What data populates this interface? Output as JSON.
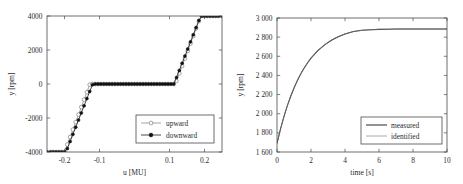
{
  "figure": {
    "background_color": "#ffffff",
    "panel_count": 2
  },
  "chart_data": [
    {
      "type": "line",
      "id": "hysteresis-characteristic",
      "title": "",
      "xlabel": "u [MU]",
      "ylabel": "y [rpm]",
      "xlim": [
        -0.25,
        0.25
      ],
      "ylim": [
        -4000,
        4000
      ],
      "xticks": [
        -0.2,
        -0.1,
        0.1,
        0.2
      ],
      "xticklabels": [
        "-0.2",
        "-0.1",
        "0.1",
        "0.2"
      ],
      "yticks": [
        -4000,
        -2000,
        0,
        2000,
        4000
      ],
      "yticklabels": [
        "-4000",
        "-2000",
        "0",
        "2000",
        "4000"
      ],
      "grid": false,
      "legend_position": "lower right",
      "marker_step": 0.008,
      "series": [
        {
          "name": "upward",
          "color": "#8d8d8d",
          "marker": "open-circle",
          "x": [
            -0.25,
            -0.24,
            -0.232,
            -0.224,
            -0.216,
            -0.208,
            -0.2,
            -0.192,
            -0.184,
            -0.176,
            -0.168,
            -0.16,
            -0.152,
            -0.144,
            -0.136,
            -0.128,
            -0.12,
            -0.112,
            -0.104,
            -0.096,
            -0.088,
            -0.08,
            -0.072,
            -0.064,
            -0.056,
            -0.048,
            -0.04,
            -0.032,
            -0.024,
            -0.016,
            -0.008,
            0.0,
            0.008,
            0.016,
            0.024,
            0.032,
            0.04,
            0.048,
            0.056,
            0.064,
            0.072,
            0.08,
            0.088,
            0.096,
            0.104,
            0.112,
            0.12,
            0.128,
            0.136,
            0.144,
            0.152,
            0.16,
            0.168,
            0.176,
            0.184,
            0.192,
            0.2,
            0.208,
            0.216,
            0.224,
            0.232,
            0.24,
            0.25
          ],
          "y": [
            -4000,
            -4000,
            -4000,
            -4000,
            -4000,
            -4000,
            -4000,
            -3560,
            -3120,
            -2680,
            -2240,
            -1800,
            -1360,
            -920,
            -480,
            -40,
            0,
            0,
            0,
            0,
            0,
            0,
            0,
            0,
            0,
            0,
            0,
            0,
            0,
            0,
            0,
            0,
            0,
            0,
            0,
            0,
            0,
            0,
            0,
            0,
            0,
            0,
            0,
            0,
            0,
            0,
            180,
            620,
            1060,
            1500,
            1940,
            2380,
            2820,
            3260,
            3700,
            4000,
            4000,
            4000,
            4000,
            4000,
            4000,
            4000,
            4000
          ]
        },
        {
          "name": "downward",
          "color": "#1c1c1c",
          "marker": "filled-circle",
          "x": [
            -0.25,
            -0.24,
            -0.232,
            -0.224,
            -0.216,
            -0.208,
            -0.2,
            -0.192,
            -0.184,
            -0.176,
            -0.168,
            -0.16,
            -0.152,
            -0.144,
            -0.136,
            -0.128,
            -0.12,
            -0.112,
            -0.104,
            -0.096,
            -0.088,
            -0.08,
            -0.072,
            -0.064,
            -0.056,
            -0.048,
            -0.04,
            -0.032,
            -0.024,
            -0.016,
            -0.008,
            0.0,
            0.008,
            0.016,
            0.024,
            0.032,
            0.04,
            0.048,
            0.056,
            0.064,
            0.072,
            0.08,
            0.088,
            0.096,
            0.104,
            0.112,
            0.12,
            0.128,
            0.136,
            0.144,
            0.152,
            0.16,
            0.168,
            0.176,
            0.184,
            0.192,
            0.2,
            0.208,
            0.216,
            0.224,
            0.232,
            0.24,
            0.25
          ],
          "y": [
            -4000,
            -4000,
            -4000,
            -4000,
            -4000,
            -4000,
            -4000,
            -3800,
            -3380,
            -2960,
            -2540,
            -2120,
            -1700,
            -1280,
            -860,
            -440,
            -40,
            0,
            0,
            0,
            0,
            0,
            0,
            0,
            0,
            0,
            0,
            0,
            0,
            0,
            0,
            0,
            0,
            0,
            0,
            0,
            0,
            0,
            0,
            0,
            0,
            0,
            0,
            0,
            0,
            0,
            380,
            800,
            1220,
            1640,
            2060,
            2480,
            2900,
            3320,
            3740,
            4000,
            4000,
            4000,
            4000,
            4000,
            4000,
            4000,
            4000
          ]
        }
      ]
    },
    {
      "type": "line",
      "id": "step-response",
      "title": "",
      "xlabel": "time [s]",
      "ylabel": "y [rpm]",
      "xlim": [
        0,
        10
      ],
      "ylim": [
        1600,
        3000
      ],
      "xticks": [
        0,
        2,
        4,
        6,
        8,
        10
      ],
      "xticklabels": [
        "0",
        "2",
        "4",
        "6",
        "8",
        "10"
      ],
      "yticks": [
        1600,
        1800,
        2000,
        2200,
        2400,
        2600,
        2800,
        3000
      ],
      "yticklabels": [
        "1 600",
        "1 800",
        "2 000",
        "2 200",
        "2 400",
        "2 600",
        "2 800",
        "3 000"
      ],
      "grid": false,
      "legend_position": "lower right",
      "series": [
        {
          "name": "measured",
          "color": "#2f2f2f",
          "steady_state": 2885,
          "initial_value": 1690,
          "time_constant": 1.55,
          "x": [
            0,
            0.2,
            0.4,
            0.6,
            0.8,
            1.0,
            1.2,
            1.4,
            1.6,
            1.8,
            2.0,
            2.4,
            2.8,
            3.2,
            3.6,
            4.0,
            4.5,
            5.0,
            5.5,
            6.0,
            6.5,
            7.0,
            7.5,
            8.0,
            8.5,
            9.0,
            9.5,
            10.0
          ],
          "y": [
            1690,
            1836,
            1965,
            2079,
            2180,
            2269,
            2348,
            2417,
            2478,
            2532,
            2580,
            2659,
            2720,
            2768,
            2805,
            2834,
            2859,
            2871,
            2878,
            2881,
            2883,
            2884,
            2885,
            2885,
            2885,
            2886,
            2886,
            2886
          ]
        },
        {
          "name": "identified",
          "color": "#7c7c7c",
          "steady_state": 2882,
          "initial_value": 1690,
          "time_constant": 1.55,
          "x": [
            0,
            0.2,
            0.4,
            0.6,
            0.8,
            1.0,
            1.2,
            1.4,
            1.6,
            1.8,
            2.0,
            2.4,
            2.8,
            3.2,
            3.6,
            4.0,
            4.5,
            5.0,
            5.5,
            6.0,
            6.5,
            7.0,
            7.5,
            8.0,
            8.5,
            9.0,
            9.5,
            10.0
          ],
          "y": [
            1690,
            1836,
            1965,
            2079,
            2180,
            2269,
            2348,
            2417,
            2478,
            2532,
            2580,
            2659,
            2720,
            2768,
            2805,
            2834,
            2859,
            2871,
            2878,
            2881,
            2883,
            2884,
            2884,
            2884,
            2884,
            2884,
            2884,
            2884
          ]
        }
      ]
    }
  ]
}
